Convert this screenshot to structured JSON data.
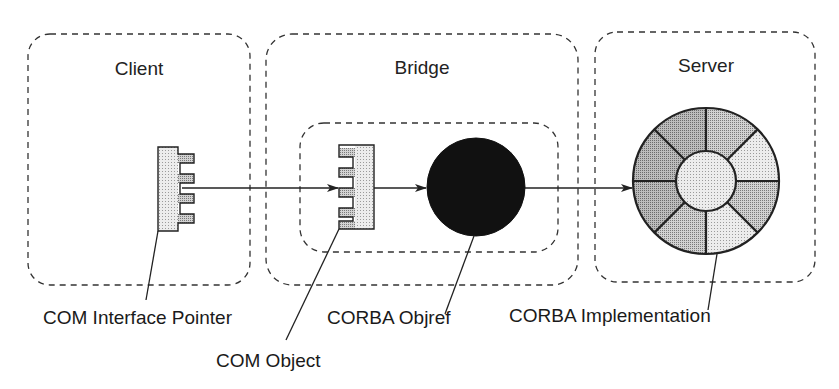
{
  "diagram": {
    "containers": [
      {
        "id": "client",
        "title": "Client"
      },
      {
        "id": "bridge",
        "title": "Bridge"
      },
      {
        "id": "server",
        "title": "Server"
      }
    ],
    "labels": {
      "com_interface_pointer": "COM Interface Pointer",
      "com_object": "COM Object",
      "corba_objref": "CORBA Objref",
      "corba_implementation": "CORBA Implementation"
    },
    "colors": {
      "stroke": "#222222",
      "comb_fill": "#e6e6e6",
      "comb_tooth_fill": "#bdbdbd",
      "objref_fill": "#111111",
      "wheel_outer_fill": "#b8b8b8",
      "wheel_outer_light": "#d6d6d6",
      "wheel_hub_fill": "#dcdcdc"
    },
    "connections": [
      {
        "from": "COM Interface Pointer",
        "to": "COM Object"
      },
      {
        "from": "COM Object",
        "to": "CORBA Objref"
      },
      {
        "from": "CORBA Objref",
        "to": "CORBA Implementation"
      }
    ]
  }
}
